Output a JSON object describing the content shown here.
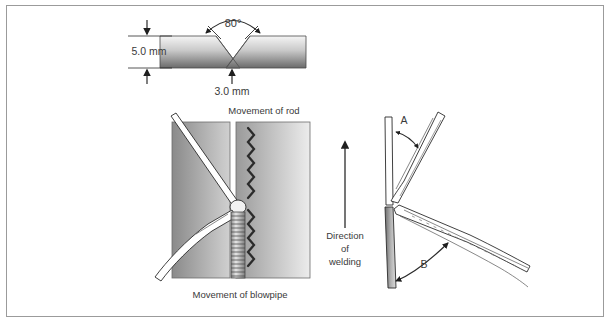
{
  "figure": {
    "border_color": "#9b9b9b",
    "background_color": "#ffffff",
    "line_color": "#2b2b2b",
    "text_color": "#3a3a3a"
  },
  "joint_detail": {
    "angle_label": "80°",
    "thickness_label": "5.0 mm",
    "root_gap_label": "3.0 mm",
    "included_angle_degrees": 80,
    "plate_thickness_mm": 5.0,
    "root_face_mm": 3.0,
    "plate_fill_top": "#f2f2f2",
    "plate_fill_bottom": "#6f6f6f"
  },
  "plan_view": {
    "top_label": "Movement of rod",
    "bottom_label": "Movement of blowpipe",
    "rod_name": "filler-rod",
    "blowpipe_name": "blowpipe",
    "plate_fill_left": "#8c8c8c",
    "plate_fill_right": "#e8e8e8",
    "weave_count": 2
  },
  "direction": {
    "line1": "Direction",
    "line2": "of",
    "line3": "welding",
    "arrow_points": "up"
  },
  "side_view": {
    "label_a": "A",
    "label_b": "B",
    "rod_name": "filler-rod",
    "blowpipe_name": "blowpipe",
    "plate_name": "workpiece-plate",
    "plate_fill_left": "#707070",
    "plate_fill_right": "#d9d9d9"
  }
}
